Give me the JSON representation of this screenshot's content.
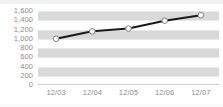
{
  "chart_data": {
    "type": "line",
    "title": "",
    "subtitle": "",
    "xlabel": "",
    "ylabel": "",
    "categories": [
      "12/03",
      "12/04",
      "12/05",
      "12/06",
      "12/07"
    ],
    "series": [
      {
        "name": "",
        "values": [
          1000,
          1160,
          1220,
          1390,
          1510
        ]
      }
    ],
    "ylim": [
      0,
      1600
    ],
    "ytick_labels": [
      "1,600",
      "1,400",
      "1,200",
      "1,000",
      "800",
      "600",
      "400",
      "200",
      "0"
    ],
    "ytick_values": [
      1600,
      1400,
      1200,
      1000,
      800,
      600,
      400,
      200,
      0
    ],
    "ytick_step": 200,
    "grid": true,
    "banded_background": true,
    "legend": false,
    "legend_position": "none",
    "marker": "circle-open",
    "colors": {
      "line": "#1a1a1a",
      "marker_fill": "#ffffff",
      "marker_stroke": "#7f7f7f",
      "band": "#d9d9d9",
      "gridline": "#e9e9e9",
      "tick_label": "#8d8d8d",
      "plot_background": "#ffffff",
      "axis_line": "#cfcfcf"
    }
  }
}
